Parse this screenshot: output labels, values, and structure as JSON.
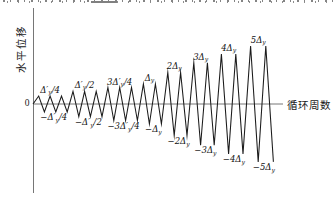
{
  "figure": {
    "ylabel": "水平位移",
    "xlabel": "循环周数",
    "origin_label": "0",
    "line_color": "#1b1b1b",
    "axis_color": "#666666"
  },
  "chart_data": {
    "type": "line",
    "subtype": "triangular cyclic loading protocol",
    "title": "",
    "xlabel": "循环周数",
    "ylabel": "水平位移",
    "y_unit": "Δ_y",
    "grid": false,
    "legend": false,
    "axis_ranges": {
      "y": [
        -5,
        5
      ]
    },
    "groups": [
      {
        "amplitude": 0.25,
        "cycles": 3,
        "peak_label": "Δ′_y/4",
        "trough_label": "−Δ′_y/4"
      },
      {
        "amplitude": 0.5,
        "cycles": 3,
        "peak_label": "Δ′_y/2",
        "trough_label": "−Δ′_y/2"
      },
      {
        "amplitude": 0.75,
        "cycles": 3,
        "peak_label": "3Δ′_y/4",
        "trough_label": "−3Δ′_y/4"
      },
      {
        "amplitude": 1,
        "cycles": 2,
        "peak_label": "Δ_y",
        "trough_label": "−Δ_y"
      },
      {
        "amplitude": 2,
        "cycles": 2,
        "peak_label": "2Δ_y",
        "trough_label": "−2Δ_y"
      },
      {
        "amplitude": 3,
        "cycles": 2,
        "peak_label": "3Δ_y",
        "trough_label": "−3Δ_y"
      },
      {
        "amplitude": 4,
        "cycles": 2,
        "peak_label": "4Δ_y",
        "trough_label": "−4Δ_y"
      },
      {
        "amplitude": 5,
        "cycles": 2,
        "peak_label": "5Δ_y",
        "trough_label": "−5Δ_y"
      }
    ]
  }
}
